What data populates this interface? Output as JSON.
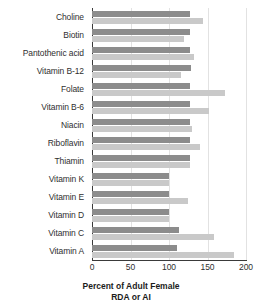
{
  "chart_data": {
    "type": "bar",
    "orientation": "horizontal",
    "title": "",
    "xlabel": "Percent of Adult Female RDA or AI",
    "xlabel_line1": "Percent of Adult Female",
    "xlabel_line2": "RDA or AI",
    "ylabel": "",
    "xlim": [
      0,
      200
    ],
    "xticks": [
      0,
      50,
      100,
      150,
      200
    ],
    "xtick_labels": [
      "0",
      "50",
      "100",
      "150",
      "200"
    ],
    "grid": true,
    "legend": false,
    "categories": [
      "Choline",
      "Biotin",
      "Pantothenic acid",
      "Vitamin B-12",
      "Folate",
      "Vitamin B-6",
      "Niacin",
      "Riboflavin",
      "Thiamin",
      "Vitamin K",
      "Vitamin E",
      "Vitamin D",
      "Vitamin C",
      "Vitamin A"
    ],
    "series": [
      {
        "name": "series-1",
        "color": "#8c8c8c",
        "values": [
          127,
          127,
          127,
          128,
          127,
          127,
          127,
          127,
          127,
          100,
          100,
          100,
          113,
          110
        ]
      },
      {
        "name": "series-2",
        "color": "#c9c9c9",
        "values": [
          144,
          120,
          133,
          116,
          173,
          152,
          130,
          140,
          127,
          100,
          125,
          100,
          159,
          184
        ]
      }
    ]
  },
  "colors": {
    "series_dark": "#8c8c8c",
    "series_light": "#c9c9c9",
    "axis": "#3a3a3a",
    "gridline": "#e2e2e2",
    "text": "#2f2f2f",
    "background": "#ffffff"
  }
}
